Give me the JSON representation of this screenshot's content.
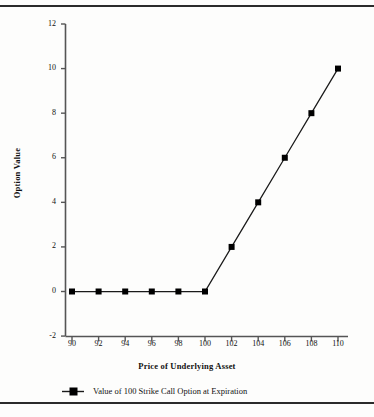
{
  "figure": {
    "background_color": "#fdfdfc",
    "rule_color": "#2b2b2b",
    "line_color": "#1a1a1a",
    "marker_color": "#000000"
  },
  "chart_data": {
    "type": "line",
    "title": "",
    "xlabel": "Price of Underlying Asset",
    "ylabel": "Option Value",
    "x": [
      90,
      92,
      94,
      96,
      98,
      100,
      102,
      104,
      106,
      108,
      110
    ],
    "xticklabels": [
      "90",
      "92",
      "94",
      "96",
      "98",
      "100",
      "102",
      "104",
      "106",
      "108",
      "110"
    ],
    "yticklabels": [
      "-2",
      "0",
      "2",
      "4",
      "6",
      "8",
      "10",
      "12"
    ],
    "yticks": [
      -2,
      0,
      2,
      4,
      6,
      8,
      10,
      12
    ],
    "xlim": [
      89,
      111
    ],
    "ylim": [
      -2,
      12
    ],
    "grid": false,
    "legend_position": "bottom-left",
    "series": [
      {
        "name": "Value of 100 Strike Call Option at Expiration",
        "values": [
          0,
          0,
          0,
          0,
          0,
          0,
          2,
          4,
          6,
          8,
          10
        ],
        "marker": "square",
        "marker_color": "#000000",
        "line_color": "#1a1a1a"
      }
    ]
  },
  "legend": {
    "entries": [
      {
        "label": "Value of 100 Strike Call Option at Expiration"
      }
    ]
  }
}
